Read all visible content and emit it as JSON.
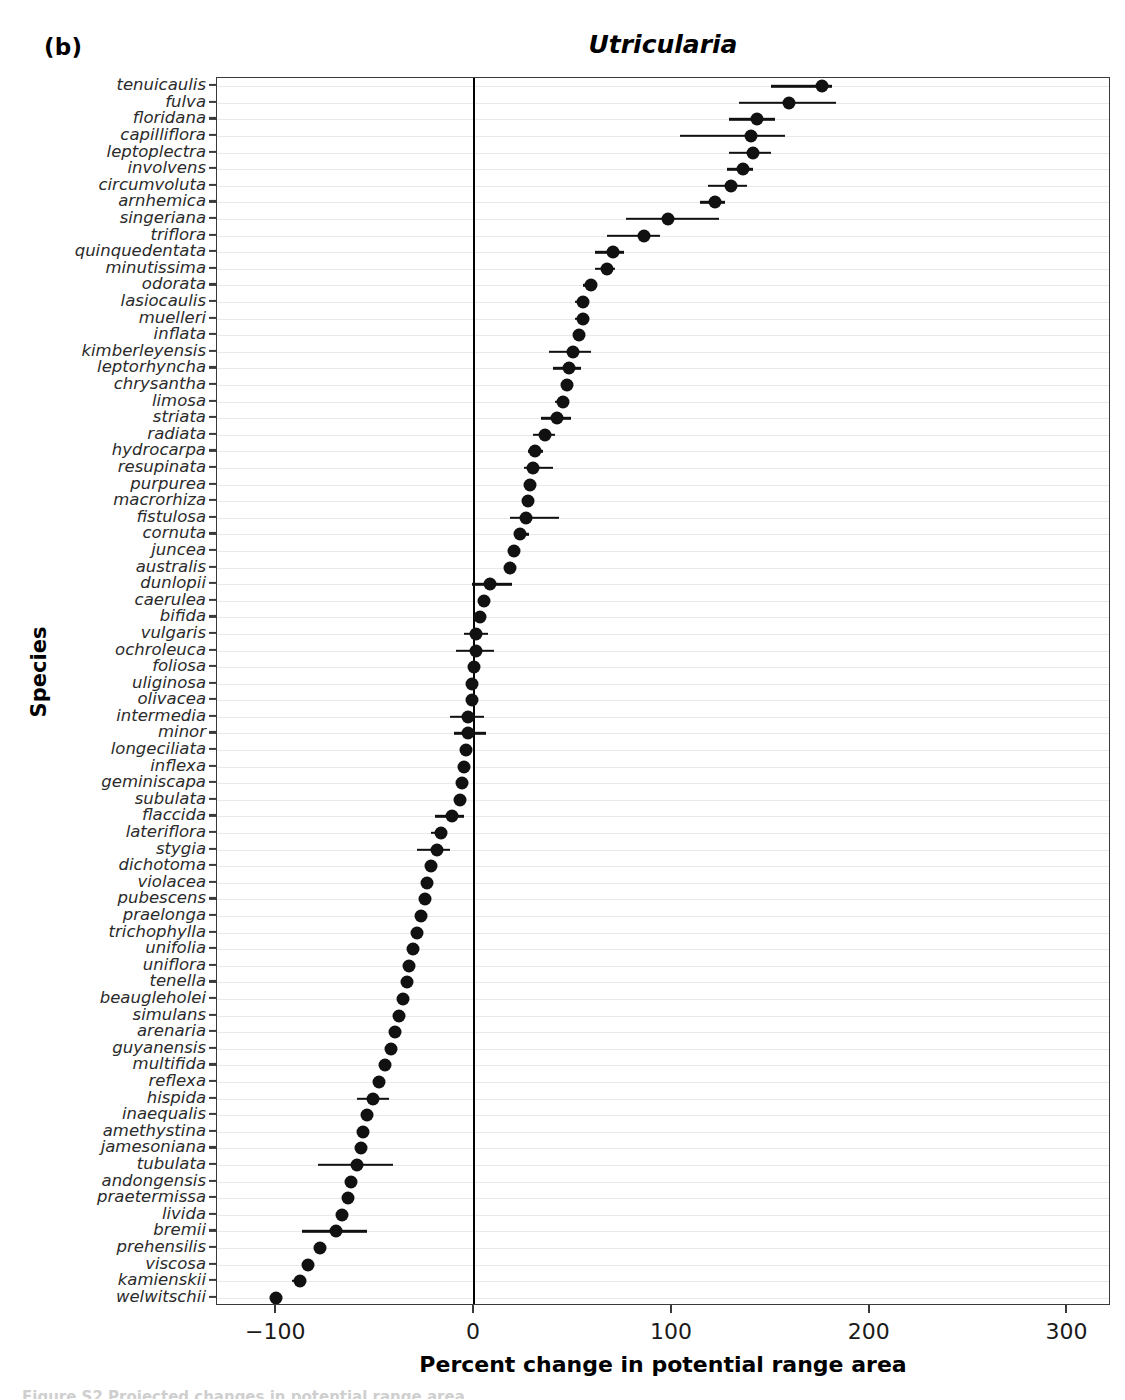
{
  "panel": {
    "label": "(b)"
  },
  "chart_data": {
    "type": "scatter",
    "subtype": "dot-whisker-forest",
    "title": "Utricularia",
    "xlabel": "Percent change in potential range area",
    "ylabel": "Species",
    "xlim": [
      -130,
      322
    ],
    "ylim_categories": 73,
    "grid": "horizontal-faint",
    "legend": "none",
    "xticks": [
      -100,
      0,
      100,
      200,
      300
    ],
    "xticklabels": [
      "−100",
      "0",
      "100",
      "200",
      "300"
    ],
    "zero_reference_line": 0,
    "categories": [
      "tenuicaulis",
      "fulva",
      "floridana",
      "capilliflora",
      "leptoplectra",
      "involvens",
      "circumvoluta",
      "arnhemica",
      "singeriana",
      "triflora",
      "quinquedentata",
      "minutissima",
      "odorata",
      "lasiocaulis",
      "muelleri",
      "inflata",
      "kimberleyensis",
      "leptorhyncha",
      "chrysantha",
      "limosa",
      "striata",
      "radiata",
      "hydrocarpa",
      "resupinata",
      "purpurea",
      "macrorhiza",
      "fistulosa",
      "cornuta",
      "juncea",
      "australis",
      "dunlopii",
      "caerulea",
      "bifida",
      "vulgaris",
      "ochroleuca",
      "foliosa",
      "uliginosa",
      "olivacea",
      "intermedia",
      "minor",
      "longeciliata",
      "inflexa",
      "geminiscapa",
      "subulata",
      "flaccida",
      "lateriflora",
      "stygia",
      "dichotoma",
      "violacea",
      "pubescens",
      "praelonga",
      "trichophylla",
      "unifolia",
      "uniflora",
      "tenella",
      "beaugleholei",
      "simulans",
      "arenaria",
      "guyanensis",
      "multifida",
      "reflexa",
      "hispida",
      "inaequalis",
      "amethystina",
      "jamesoniana",
      "tubulata",
      "andongensis",
      "praetermissa",
      "livida",
      "bremii",
      "prehensilis",
      "viscosa",
      "kamienskii",
      "welwitschii"
    ],
    "values": [
      176,
      159,
      143,
      140,
      141,
      136,
      130,
      122,
      98,
      86,
      70,
      67,
      59,
      55,
      55,
      53,
      50,
      48,
      47,
      45,
      42,
      36,
      31,
      30,
      28,
      27,
      26,
      23,
      20,
      18,
      8,
      5,
      3,
      1,
      1,
      0,
      -1,
      -1,
      -3,
      -3,
      -4,
      -5,
      -6,
      -7,
      -11,
      -17,
      -19,
      -22,
      -24,
      -25,
      -27,
      -29,
      -31,
      -33,
      -34,
      -36,
      -38,
      -40,
      -42,
      -45,
      -48,
      -51,
      -54,
      -56,
      -57,
      -59,
      -62,
      -64,
      -67,
      -70,
      -78,
      -84,
      -88,
      -100
    ],
    "ci_low": [
      150,
      134,
      129,
      104,
      129,
      128,
      118,
      114,
      77,
      67,
      61,
      61,
      55,
      51,
      51,
      50,
      38,
      40,
      44,
      41,
      34,
      30,
      27,
      25,
      25,
      24,
      18,
      20,
      18,
      16,
      -1,
      2,
      1,
      -5,
      -9,
      -2,
      -3,
      -3,
      -12,
      -10,
      -7,
      -7,
      -8,
      -9,
      -20,
      -22,
      -29,
      -25,
      -26,
      -27,
      -29,
      -31,
      -33,
      -35,
      -36,
      -38,
      -40,
      -43,
      -45,
      -48,
      -51,
      -59,
      -57,
      -59,
      -60,
      -79,
      -65,
      -67,
      -70,
      -87,
      -81,
      -86,
      -92,
      -103
    ],
    "ci_high": [
      181,
      183,
      152,
      157,
      150,
      141,
      138,
      127,
      124,
      94,
      76,
      71,
      62,
      58,
      58,
      56,
      59,
      54,
      49,
      48,
      49,
      41,
      35,
      40,
      31,
      30,
      43,
      28,
      22,
      21,
      19,
      8,
      5,
      7,
      10,
      2,
      1,
      1,
      5,
      6,
      -1,
      -3,
      -4,
      -5,
      -5,
      -14,
      -12,
      -19,
      -22,
      -23,
      -25,
      -27,
      -29,
      -31,
      -32,
      -34,
      -36,
      -38,
      -40,
      -42,
      -45,
      -43,
      -51,
      -53,
      -54,
      -41,
      -59,
      -62,
      -64,
      -54,
      -75,
      -82,
      -85,
      -97
    ]
  },
  "caption": {
    "remnant": "Figure S2 Projected changes in potential range area"
  }
}
